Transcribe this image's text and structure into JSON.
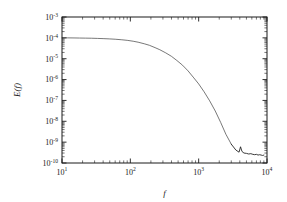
{
  "chart_data": {
    "type": "line",
    "title": "",
    "subtitle": "",
    "xlabel": "f",
    "ylabel": "E(f)",
    "xscale": "log",
    "yscale": "log",
    "xlim": [
      10,
      10000
    ],
    "ylim": [
      1e-10,
      0.001
    ],
    "grid": false,
    "legend": null,
    "xticklabels": [
      "10",
      "10",
      "10",
      "10"
    ],
    "xtickexponents": [
      "1",
      "2",
      "3",
      "4"
    ],
    "xtickvalues": [
      10,
      100,
      1000,
      10000
    ],
    "yticklabels": [
      "10",
      "10",
      "10",
      "10",
      "10",
      "10",
      "10",
      "10"
    ],
    "ytickexponents": [
      "-3",
      "-4",
      "-5",
      "-6",
      "-7",
      "-8",
      "-9",
      "-10"
    ],
    "ytickvalues": [
      0.001,
      0.0001,
      1e-05,
      1e-06,
      1e-07,
      1e-08,
      1e-09,
      1e-10
    ],
    "series": [
      {
        "name": "E(f)",
        "color": "#3d3d3d",
        "x": [
          10,
          12,
          15,
          18,
          22,
          27,
          33,
          40,
          50,
          60,
          75,
          90,
          110,
          130,
          160,
          190,
          230,
          270,
          330,
          400,
          480,
          580,
          700,
          850,
          1000,
          1200,
          1450,
          1750,
          2100,
          2500,
          3000,
          3500,
          3900,
          4100,
          4300,
          4600,
          5000,
          5400,
          5800,
          6200,
          6600,
          7000,
          7400,
          7800,
          8200,
          8600,
          9000
        ],
        "y": [
          0.0001,
          0.0001,
          9.9e-05,
          9.8e-05,
          9.7e-05,
          9.6e-05,
          9.4e-05,
          9.2e-05,
          8.9e-05,
          8.6e-05,
          8.1e-05,
          7.6e-05,
          6.9e-05,
          6.2e-05,
          5.2e-05,
          4.4e-05,
          3.4e-05,
          2.7e-05,
          1.9e-05,
          1.3e-05,
          8.2e-06,
          4.9e-06,
          2.6e-06,
          1.2e-06,
          6.2e-07,
          2.6e-07,
          9.5e-08,
          3.1e-08,
          8.8e-09,
          2.4e-09,
          8e-10,
          4.2e-10,
          3.3e-10,
          6e-10,
          3.6e-10,
          3e-10,
          2.9e-10,
          2.7e-10,
          2.8e-10,
          2.6e-10,
          2.5e-10,
          2.6e-10,
          2.4e-10,
          2.5e-10,
          2.4e-10,
          2.3e-10,
          2.4e-10
        ]
      }
    ],
    "annotations": [
      {
        "label": "noise-floor-notch",
        "x": 4100,
        "y": 6e-10
      }
    ]
  }
}
